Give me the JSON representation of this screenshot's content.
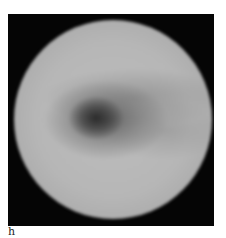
{
  "figure": {
    "panel_label": "h",
    "image": {
      "description": "grayscale circular disc on black background with dark off-center blob",
      "background_color": "#050505",
      "disc_color": "#bdbdbd",
      "dark_region_color": "#3c3c3c"
    }
  }
}
